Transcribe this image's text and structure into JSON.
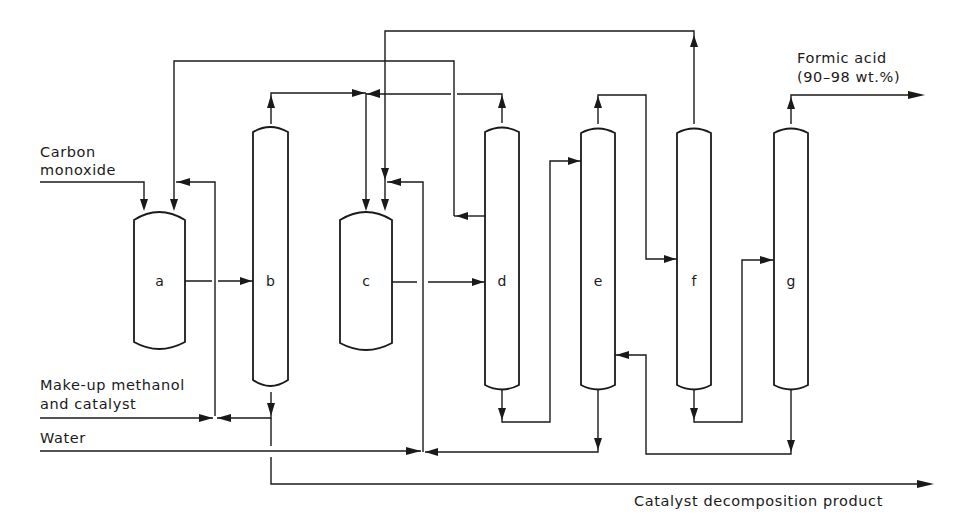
{
  "diagram": {
    "units": [
      {
        "id": "a",
        "label": "a",
        "type": "reactor"
      },
      {
        "id": "b",
        "label": "b",
        "type": "column"
      },
      {
        "id": "c",
        "label": "c",
        "type": "reactor"
      },
      {
        "id": "d",
        "label": "d",
        "type": "column"
      },
      {
        "id": "e",
        "label": "e",
        "type": "column"
      },
      {
        "id": "f",
        "label": "f",
        "type": "column"
      },
      {
        "id": "g",
        "label": "g",
        "type": "column"
      }
    ],
    "streams": {
      "carbon_monoxide_line1": "Carbon",
      "carbon_monoxide_line2": "monoxide",
      "methanol_line1": "Make-up methanol",
      "methanol_line2": "and catalyst",
      "water": "Water",
      "formic_acid_line1": "Formic acid",
      "formic_acid_line2": "(90–98 wt.%)",
      "catalyst_decomposition": "Catalyst decomposition product"
    }
  }
}
